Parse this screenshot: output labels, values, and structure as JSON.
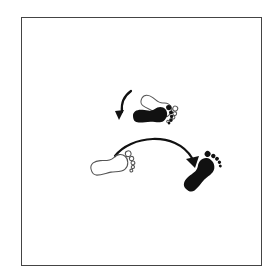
{
  "figure": {
    "colors": {
      "ink": "#111111",
      "outline": "#555555",
      "frame": "#444444",
      "background": "#ffffff"
    },
    "elements": [
      {
        "id": "pivot-arrow",
        "type": "curved-arrow",
        "direction": "counter-clockwise, down-left"
      },
      {
        "id": "upper-start-foot",
        "type": "footprint",
        "style": "outline",
        "side": "right"
      },
      {
        "id": "upper-end-foot",
        "type": "footprint",
        "style": "filled",
        "side": "right"
      },
      {
        "id": "step-arrow",
        "type": "arc-arrow",
        "direction": "left-to-right"
      },
      {
        "id": "lower-start-foot",
        "type": "footprint",
        "style": "outline",
        "side": "right"
      },
      {
        "id": "lower-end-foot",
        "type": "footprint",
        "style": "filled",
        "side": "right"
      }
    ]
  }
}
